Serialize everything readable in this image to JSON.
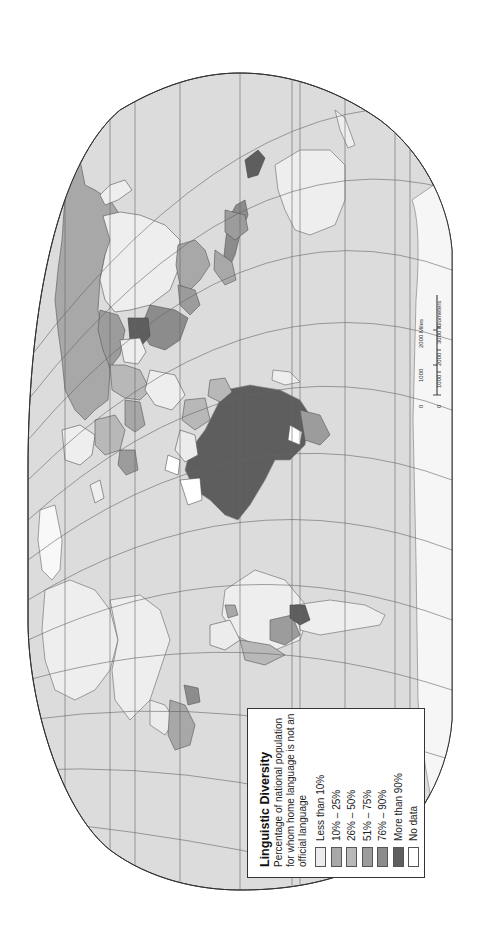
{
  "map": {
    "orientation": "rotated-90-ccw",
    "projection_outline": "Robinson-like ellipse",
    "colors": {
      "ocean": "#dcdcdc",
      "graticule": "#666666",
      "border": "#555555",
      "less_than_10": "#ececec",
      "pct_10_25": "#a8a8a8",
      "pct_26_50": "#b8b8b8",
      "pct_51_75": "#9c9c9c",
      "pct_76_90": "#8c8c8c",
      "more_than_90": "#5e5e5e",
      "no_data": "#ffffff"
    }
  },
  "legend": {
    "title": "Linguistic Diversity",
    "subtitle": "Percentage of national population for whom home language is not an official language",
    "items": [
      {
        "label": "Less than 10%",
        "color": "#ececec"
      },
      {
        "label": "10% – 25%",
        "color": "#a8a8a8"
      },
      {
        "label": "26% – 50%",
        "color": "#b8b8b8"
      },
      {
        "label": "51% – 75%",
        "color": "#9c9c9c"
      },
      {
        "label": "76% – 90%",
        "color": "#8c8c8c"
      },
      {
        "label": "More than 90%",
        "color": "#5e5e5e"
      },
      {
        "label": "No data",
        "color": "#ffffff"
      }
    ]
  },
  "scale_bar": {
    "miles_label": "2000 Miles",
    "miles_ticks": [
      "0",
      "1000",
      "2000 Miles"
    ],
    "km_ticks": [
      "0",
      "1000",
      "2000",
      "3000 Kilometers"
    ]
  }
}
